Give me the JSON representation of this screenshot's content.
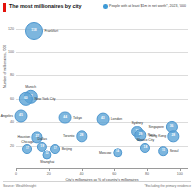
{
  "header": {
    "title": "The most millionaires by city",
    "legend_label": "People with at least $1m in net worth*, 2023, '000"
  },
  "footer": {
    "source": "Source: WealthInsight",
    "footnote": "*Excluding the primary residence"
  },
  "colors": {
    "brand_red": "#e3120b",
    "bubble": "#5ca4d6",
    "grid": "#dcdcdc",
    "text": "#121212"
  },
  "chart_data": {
    "type": "scatter",
    "title": "The most millionaires by city",
    "subtitle": "People with at least $1m in net worth*, 2023, '000",
    "xlabel": "City's millionaires as % of country's millionaires",
    "ylabel": "Number of millionaires, '000",
    "xlim": [
      0,
      105
    ],
    "ylim": [
      0,
      130
    ],
    "xticks": [
      "0",
      "20",
      "40",
      "60",
      "80",
      "100"
    ],
    "xtick_values": [
      0,
      20,
      40,
      60,
      80,
      100
    ],
    "yticks": [
      "20",
      "40",
      "60",
      "80",
      "100",
      "120"
    ],
    "ytick_values": [
      20,
      40,
      60,
      80,
      100,
      120
    ],
    "grid": "horizontal",
    "legend_position": "top-right",
    "bubble_value_unit": "thousands of millionaires",
    "points": [
      {
        "city": "Frankfurt",
        "x": 11,
        "y": 118,
        "value": 118,
        "label_pos": "right"
      },
      {
        "city": "Munich",
        "x": 9,
        "y": 62,
        "value": 62,
        "label_pos": "top"
      },
      {
        "city": "New York City",
        "x": 6,
        "y": 60,
        "value": 60,
        "label_pos": "right"
      },
      {
        "city": "Los Angeles",
        "x": 3,
        "y": 45,
        "value": 45,
        "label_pos": "left"
      },
      {
        "city": "Tokyo",
        "x": 30,
        "y": 44,
        "value": 44,
        "label_pos": "right"
      },
      {
        "city": "London",
        "x": 53,
        "y": 43,
        "value": 43,
        "label_pos": "right"
      },
      {
        "city": "Sydney",
        "x": 74,
        "y": 32,
        "value": 32,
        "label_pos": "top"
      },
      {
        "city": "Paris",
        "x": 76,
        "y": 29,
        "value": 29,
        "label_pos": "right"
      },
      {
        "city": "Toronto",
        "x": 40,
        "y": 28,
        "value": 28,
        "label_pos": "left"
      },
      {
        "city": "Houston",
        "x": 13,
        "y": 27,
        "value": 27,
        "label_pos": "left"
      },
      {
        "city": "Singapore",
        "x": 95,
        "y": 36,
        "value": 36,
        "label_pos": "left"
      },
      {
        "city": "Hong Kong",
        "x": 96,
        "y": 28,
        "value": 28,
        "label_pos": "left"
      },
      {
        "city": "Chicago",
        "x": 7,
        "y": 17,
        "value": 17,
        "label_pos": "top"
      },
      {
        "city": "Dallas",
        "x": 16,
        "y": 19,
        "value": 19,
        "label_pos": "top"
      },
      {
        "city": "Beijing",
        "x": 24,
        "y": 17,
        "value": 17,
        "label_pos": "right"
      },
      {
        "city": "Shanghai",
        "x": 19,
        "y": 12,
        "value": 12,
        "label_pos": "bottom"
      },
      {
        "city": "Moscow",
        "x": 62,
        "y": 14,
        "value": 14,
        "label_pos": "left"
      },
      {
        "city": "Mexico City",
        "x": 79,
        "y": 18,
        "value": 18,
        "label_pos": "top"
      },
      {
        "city": "Seoul",
        "x": 90,
        "y": 15,
        "value": 15,
        "label_pos": "right"
      }
    ]
  }
}
